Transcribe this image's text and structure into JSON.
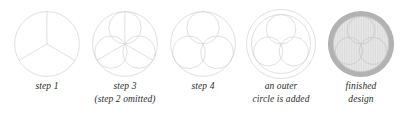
{
  "illustration": {
    "title": "Construction steps of a triskelion design",
    "background_color": "#ffffff",
    "line_color": "#cfcfcf",
    "caption_color": "#2b2b2b",
    "finished_ring_color": "#b2b2b2",
    "finished_fill_color": "#e3e3e3",
    "finished_hatch_color": "#d2d2d2"
  },
  "steps": [
    {
      "id": "step-1",
      "art": "circle-divided-in-three",
      "caption_line1": "step 1",
      "caption_line2": ""
    },
    {
      "id": "step-3",
      "art": "three-overlapping-circles",
      "caption_line1": "step 3",
      "caption_line2": "(step 2 omitted)"
    },
    {
      "id": "step-4",
      "art": "triskelion-spiral",
      "caption_line1": "step 4",
      "caption_line2": ""
    },
    {
      "id": "outer-circle",
      "art": "triskelion-with-outer-circle",
      "caption_line1": "an outer",
      "caption_line2": "circle is added"
    },
    {
      "id": "finished",
      "art": "finished-shaded-design",
      "caption_line1": "finished",
      "caption_line2": "design"
    }
  ]
}
